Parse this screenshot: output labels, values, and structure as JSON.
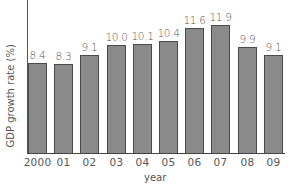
{
  "chart_data": {
    "type": "bar",
    "title": "",
    "xlabel": "year",
    "ylabel": "GDP growth rate (%)",
    "categories": [
      "2000",
      "01",
      "02",
      "03",
      "04",
      "05",
      "06",
      "07",
      "08",
      "09"
    ],
    "values": [
      8.4,
      8.3,
      9.1,
      10.0,
      10.1,
      10.4,
      11.6,
      11.9,
      9.9,
      9.1
    ],
    "value_labels": [
      "8.4",
      "8.3",
      "9.1",
      "10.0",
      "10.1",
      "10.4",
      "11.6",
      "11.9",
      "9.9",
      "9.1"
    ],
    "ylim": [
      0,
      13
    ],
    "grid": false,
    "legend": null,
    "colors": {
      "bar_fill": "#8a8a8a",
      "bar_outline": "#4a4a4a",
      "axis": "#444444",
      "text": "#555555"
    }
  }
}
